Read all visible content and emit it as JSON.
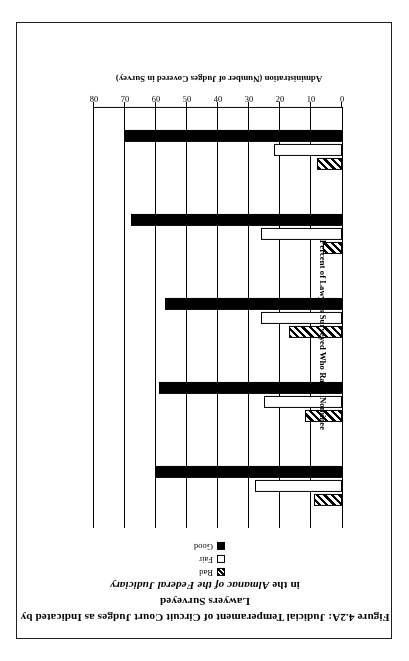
{
  "figure": {
    "title_line1": "Figure 4.2A: Judicial Temperament of Circuit Court Judges as Indicated by Lawyers Surveyed",
    "title_line2_prefix": "in the ",
    "title_line2_italic": "Almanac of the Federal Judiciary"
  },
  "legend": {
    "position": "top-center",
    "items": [
      {
        "label": "Bad",
        "key": "hatched"
      },
      {
        "label": "Fair",
        "key": "white"
      },
      {
        "label": "Good",
        "key": "black"
      }
    ]
  },
  "chart_data": {
    "type": "bar",
    "orientation": "horizontal",
    "title": "Figure 4.2A: Judicial Temperament of Circuit Court Judges as Indicated by Lawyers Surveyed in the Almanac of the Federal Judiciary",
    "xlabel": "Administration (Number of Judges Covered in Survey)",
    "ylabel": "Percent of Lawyers Surveyed Who Rated Nominee",
    "xlim": [
      0,
      80
    ],
    "xticks": [
      0,
      10,
      20,
      30,
      40,
      50,
      60,
      70,
      80
    ],
    "grid": true,
    "legend_position": "top-center",
    "categories": [
      "Carter (30)",
      "Reagan (66)",
      "Bush I (36)",
      "Clinton (55)",
      "Bush II (7)"
    ],
    "series": [
      {
        "name": "Bad",
        "values": [
          9,
          12,
          17,
          6,
          8
        ]
      },
      {
        "name": "Fair",
        "values": [
          28,
          25,
          26,
          26,
          22
        ]
      },
      {
        "name": "Good",
        "values": [
          60,
          59,
          57,
          68,
          70
        ]
      }
    ]
  },
  "axis": {
    "tick_labels": [
      "0",
      "10",
      "20",
      "30",
      "40",
      "50",
      "60",
      "70",
      "80"
    ],
    "category_axis_title": "Administration (Number of Judges Covered in Survey)",
    "value_axis_title": "Percent of Lawyers Surveyed Who Rated Nominee"
  }
}
